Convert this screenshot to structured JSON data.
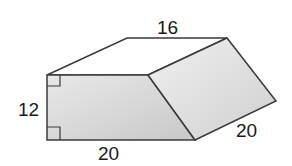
{
  "figure": {
    "type": "prism",
    "labels": {
      "top": "16",
      "left": "12",
      "bottom": "20",
      "slant": "20"
    },
    "right_angle_marks": 2,
    "colors": {
      "front_face": "#d4d4d4",
      "side_face": "#dcdcdc",
      "top_face": "#ffffff",
      "edge": "#3a3a3a"
    }
  }
}
